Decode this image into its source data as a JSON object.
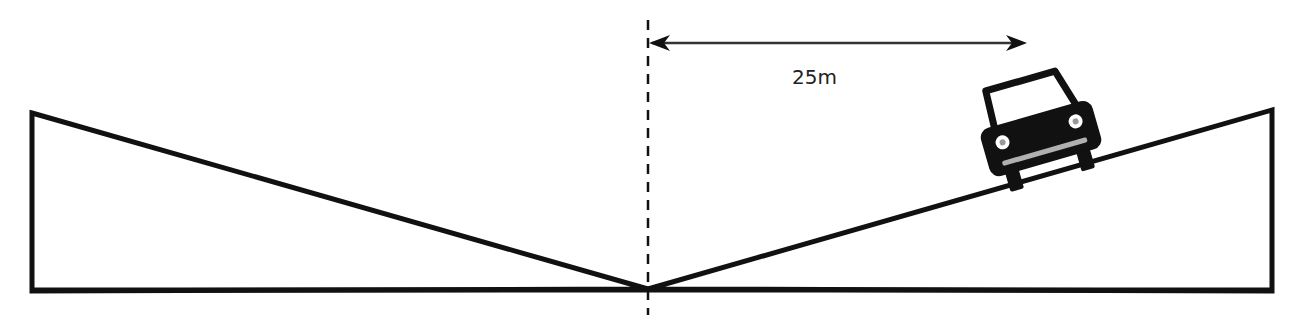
{
  "diagram": {
    "type": "ramp-distance-illustration",
    "distance_label": "25m",
    "colors": {
      "stroke": "#111111",
      "background": "#ffffff",
      "bumper": "#b0b0b0"
    },
    "elements": {
      "left_ramp": "descending slope from left edge to center",
      "right_ramp": "ascending slope from center to right edge",
      "center_line": "vertical dashed reference line",
      "distance_arrow": "double-headed arrow from center line to car",
      "car": "car front icon on right ramp"
    }
  }
}
